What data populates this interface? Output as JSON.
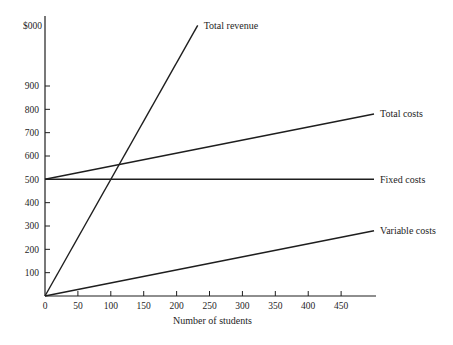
{
  "figure": {
    "background": "#ffffff",
    "ink": "#1e1e1e"
  },
  "chart_data": {
    "type": "line",
    "title": "",
    "xlabel": "Number of students",
    "ylabel": "$000",
    "xlim": [
      0,
      503
    ],
    "ylim": [
      0,
      1200
    ],
    "x_ticks": [
      0,
      50,
      100,
      150,
      200,
      250,
      300,
      350,
      400,
      450
    ],
    "y_ticks": [
      100,
      200,
      300,
      400,
      500,
      600,
      700,
      800,
      900
    ],
    "grid": false,
    "legend_position": "line-end-labels",
    "series": [
      {
        "name": "Total revenue",
        "label": "Total revenue",
        "points": [
          [
            0,
            0
          ],
          [
            232,
            1160
          ]
        ]
      },
      {
        "name": "Total costs",
        "label": "Total costs",
        "points": [
          [
            0,
            500
          ],
          [
            500,
            780
          ]
        ]
      },
      {
        "name": "Fixed costs",
        "label": "Fixed costs",
        "points": [
          [
            0,
            500
          ],
          [
            500,
            500
          ]
        ]
      },
      {
        "name": "Variable costs",
        "label": "Variable costs",
        "points": [
          [
            0,
            0
          ],
          [
            500,
            280
          ]
        ]
      }
    ]
  }
}
